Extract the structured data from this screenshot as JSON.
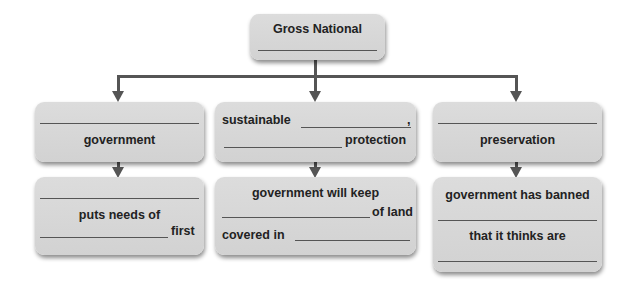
{
  "diagram": {
    "root": {
      "title": "Gross National",
      "blank": "__________"
    },
    "level1": [
      {
        "id": "left",
        "line1_blank": "__________",
        "line2": "government"
      },
      {
        "id": "middle",
        "line1_prefix": "sustainable",
        "line1_suffix": ",",
        "line2_suffix": "protection"
      },
      {
        "id": "right",
        "line1_blank": "__________",
        "line2": "preservation"
      }
    ],
    "level2": [
      {
        "id": "left",
        "line2": "puts needs of",
        "line3_suffix": "first"
      },
      {
        "id": "middle",
        "line1": "government will keep",
        "line2_suffix": "of land",
        "line3_prefix": "covered in"
      },
      {
        "id": "right",
        "line1": "government has banned",
        "line3": "that it thinks are"
      }
    ],
    "colors": {
      "box_fill": "#d6d6d6",
      "connector": "#555555",
      "text": "#222222",
      "background": "#ffffff"
    }
  }
}
